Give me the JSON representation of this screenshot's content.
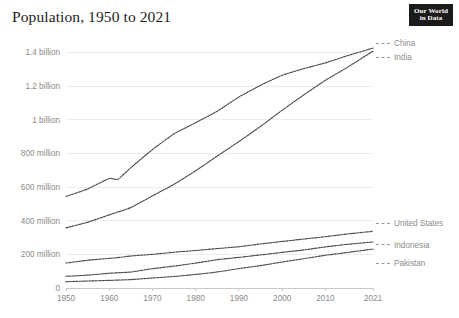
{
  "header": {
    "title": "Population, 1950 to 2021",
    "logo": {
      "line1": "Our World",
      "line2": "in Data",
      "name": "our-world-in-data-logo"
    }
  },
  "colors": {
    "background": "#ffffff",
    "line": "#4a4a4a",
    "grid": "#ececec",
    "tick_text": "#8a8a8a",
    "title_text": "#1d1d1d",
    "logo_background": "#1b1b1b"
  },
  "chart_data": {
    "type": "line",
    "title": "Population, 1950 to 2021",
    "xlabel": "",
    "ylabel": "",
    "xlim": [
      1950,
      2021
    ],
    "ylim": [
      0,
      1450000000
    ],
    "grid": true,
    "legend_position": "right-inline",
    "x_ticks": [
      "1950",
      "1960",
      "1970",
      "1980",
      "1990",
      "2000",
      "2010",
      "2021"
    ],
    "x_tick_values": [
      1950,
      1960,
      1970,
      1980,
      1990,
      2000,
      2010,
      2021
    ],
    "y_ticks": [
      "0",
      "200 million",
      "400 million",
      "600 million",
      "800 million",
      "1 billion",
      "1.2 billion",
      "1.4 billion"
    ],
    "y_tick_values": [
      0,
      200000000,
      400000000,
      600000000,
      800000000,
      1000000000,
      1200000000,
      1400000000
    ],
    "x": [
      1950,
      1955,
      1960,
      1962,
      1965,
      1970,
      1975,
      1980,
      1985,
      1990,
      1995,
      2000,
      2005,
      2010,
      2015,
      2021
    ],
    "series": [
      {
        "name": "China",
        "values": [
          543979000,
          588442000,
          650661000,
          645600000,
          715185000,
          822534000,
          916395000,
          982372000,
          1051040000,
          1135185000,
          1204855000,
          1264099000,
          1303720000,
          1337705000,
          1379860000,
          1425893000
        ]
      },
      {
        "name": "India",
        "values": [
          357021000,
          390901000,
          434605000,
          451500000,
          478167000,
          547570000,
          616493000,
          696828000,
          784360000,
          870452000,
          960482000,
          1056576000,
          1147610000,
          1234281000,
          1310152000,
          1407564000
        ]
      },
      {
        "name": "United States",
        "values": [
          148282000,
          165093000,
          176189000,
          180671000,
          190000000,
          200328000,
          212637000,
          223140000,
          234308000,
          245418000,
          261635000,
          276435000,
          291156000,
          304906000,
          320878000,
          336997000
        ]
      },
      {
        "name": "Indonesia",
        "values": [
          69543000,
          76400000,
          87751000,
          90500000,
          95100000,
          114793000,
          129951000,
          148177000,
          168300000,
          182160000,
          196958000,
          211514000,
          226289000,
          244016000,
          259091000,
          273753000
        ]
      },
      {
        "name": "Pakistan",
        "values": [
          37542000,
          41400000,
          45320000,
          47000000,
          50100000,
          59291000,
          68483000,
          80624000,
          95525000,
          115414000,
          133116000,
          154370000,
          174000000,
          194454000,
          210969000,
          231402000
        ]
      }
    ]
  },
  "legend": {
    "top_group": [
      {
        "label": "China",
        "name": "legend-item-china"
      },
      {
        "label": "India",
        "name": "legend-item-india"
      }
    ],
    "bottom_group": [
      {
        "label": "United States",
        "name": "legend-item-united-states"
      },
      {
        "label": "Indonesia",
        "name": "legend-item-indonesia"
      },
      {
        "label": "Pakistan",
        "name": "legend-item-pakistan"
      }
    ]
  }
}
